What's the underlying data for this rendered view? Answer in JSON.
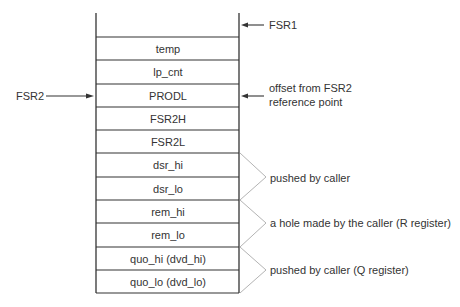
{
  "stack": {
    "cells": [
      {
        "label": "temp"
      },
      {
        "label": "lp_cnt"
      },
      {
        "label": "PRODL"
      },
      {
        "label": "FSR2H"
      },
      {
        "label": "FSR2L"
      },
      {
        "label": "dsr_hi"
      },
      {
        "label": "dsr_lo"
      },
      {
        "label": "rem_hi"
      },
      {
        "label": "rem_lo"
      },
      {
        "label": "quo_hi (dvd_hi)"
      },
      {
        "label": "quo_lo (dvd_lo)"
      }
    ]
  },
  "pointers": {
    "fsr1": "FSR1",
    "fsr2": "FSR2",
    "offset_line1": "offset from FSR2",
    "offset_line2": "reference point"
  },
  "braces": [
    {
      "label": "pushed by caller"
    },
    {
      "label": "a  hole made by the caller (R register)"
    },
    {
      "label": "pushed by caller (Q register)"
    }
  ],
  "colors": {
    "line": "#333333",
    "brace": "#aaaaaa",
    "text": "#333333"
  }
}
